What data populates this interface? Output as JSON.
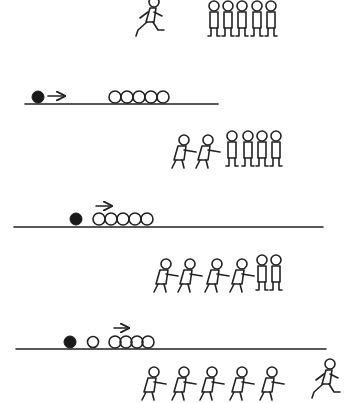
{
  "figure": {
    "colors": {
      "ink": "#222222",
      "background": "#ffffff"
    },
    "panels": [
      {
        "id": "kids-before",
        "kind": "children-row",
        "runner_position": "left",
        "runner_count": 1,
        "standing_children": 5
      },
      {
        "id": "balls-before",
        "kind": "ball-row",
        "black_ball": true,
        "arrow_over": "black-ball",
        "white_balls": 5,
        "gap_between_black_and_row": "large"
      },
      {
        "id": "kids-impact",
        "kind": "children-row",
        "pushing_children": 2,
        "standing_children": 4
      },
      {
        "id": "balls-impact",
        "kind": "ball-row",
        "black_ball": true,
        "arrow_over": "white-row",
        "white_balls": 5,
        "gap_between_black_and_row": "small"
      },
      {
        "id": "kids-propagate",
        "kind": "children-row",
        "pushing_children": 4,
        "standing_children": 2
      },
      {
        "id": "balls-after",
        "kind": "ball-row",
        "black_ball": true,
        "arrow_over": "white-row",
        "white_balls": 5,
        "separated_ball": 1
      },
      {
        "id": "kids-after",
        "kind": "children-row",
        "pushing_children": 5,
        "runner_position": "right",
        "runner_count": 1
      }
    ]
  }
}
